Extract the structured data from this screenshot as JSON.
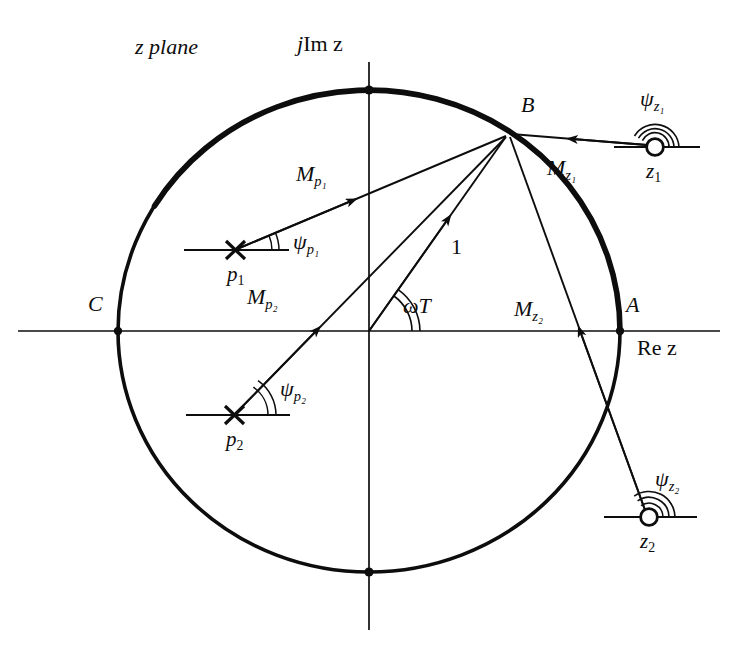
{
  "figure": {
    "kind": "z-plane pole-zero vector diagram",
    "plane_label": "z plane",
    "imag_axis_label_prefix": "j",
    "imag_axis_label_body": "Im z",
    "real_axis_label": "Re z",
    "unit_circle_radius_label": "1",
    "angle_label": "ωT",
    "colors": {
      "ink": "#0d0d0d",
      "paper": "#ffffff"
    }
  },
  "points": {
    "A": {
      "label": "A",
      "x": 620,
      "y": 331,
      "note": "unit circle on positive real axis"
    },
    "B": {
      "label": "B",
      "x": 508,
      "y": 134,
      "note": "operating point on unit circle"
    },
    "C": {
      "label": "C",
      "x": 118,
      "y": 331,
      "note": "unit circle on negative real axis"
    },
    "origin": {
      "x": 369,
      "y": 331
    }
  },
  "poles": [
    {
      "id": "p1",
      "label": "p",
      "sub": "1",
      "x": 235,
      "y": 250,
      "marker": "cross"
    },
    {
      "id": "p2",
      "label": "p",
      "sub": "2",
      "x": 234,
      "y": 415,
      "marker": "cross"
    }
  ],
  "zeros": [
    {
      "id": "z1",
      "label": "z",
      "sub": "1",
      "x": 655,
      "y": 147,
      "marker": "circle"
    },
    {
      "id": "z2",
      "label": "z",
      "sub": "2",
      "x": 649,
      "y": 517,
      "marker": "circle"
    }
  ],
  "vectors": [
    {
      "id": "Mp1",
      "label": "M",
      "sub": "p₁",
      "from": "p1",
      "to": "B",
      "label_x": 302,
      "label_y": 176
    },
    {
      "id": "Mp2",
      "label": "M",
      "sub": "p₂",
      "from": "p2",
      "to": "B",
      "label_x": 253,
      "label_y": 297
    },
    {
      "id": "Mz1",
      "label": "M",
      "sub": "z₁",
      "from": "z1",
      "to": "B",
      "label_x": 553,
      "label_y": 168
    },
    {
      "id": "Mz2",
      "label": "M",
      "sub": "z₂",
      "from": "z2",
      "to": "B",
      "label_x": 520,
      "label_y": 308
    },
    {
      "id": "unit",
      "label": "1",
      "from": "origin",
      "to": "B",
      "label_x": 450,
      "label_y": 246
    }
  ],
  "angles": [
    {
      "id": "psi_p1",
      "label": "ψ",
      "sub": "p₁",
      "at": "p1",
      "label_x": 298,
      "label_y": 243
    },
    {
      "id": "psi_p2",
      "label": "ψ",
      "sub": "p₂",
      "at": "p2",
      "label_x": 285,
      "label_y": 390
    },
    {
      "id": "psi_z1",
      "label": "ψ",
      "sub": "z₁",
      "at": "z1",
      "label_x": 645,
      "label_y": 100
    },
    {
      "id": "psi_z2",
      "label": "ψ",
      "sub": "z₂",
      "at": "z2",
      "label_x": 660,
      "label_y": 480
    },
    {
      "id": "omegaT",
      "label": "ωT",
      "at": "origin",
      "label_x": 404,
      "label_y": 306
    }
  ],
  "axis_labels": {
    "plane": {
      "text": "z plane",
      "x": 135,
      "y": 48
    },
    "imag": {
      "text": "jIm z",
      "x": 300,
      "y": 45
    },
    "real": {
      "text": "Re z",
      "x": 637,
      "y": 348
    }
  },
  "point_labels": {
    "A": {
      "x": 627,
      "y": 305
    },
    "B": {
      "x": 523,
      "y": 104
    },
    "C": {
      "x": 90,
      "y": 303
    }
  }
}
